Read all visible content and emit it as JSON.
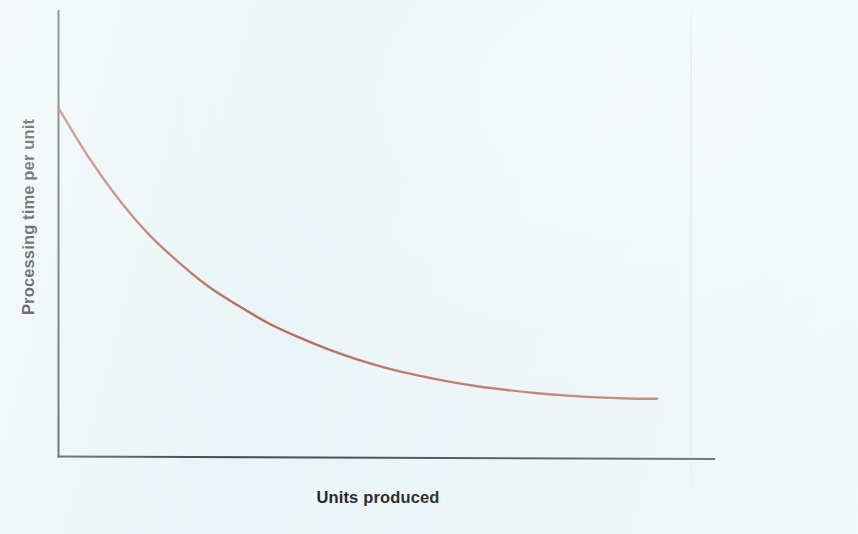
{
  "figure": {
    "background_color": "#eaf4f6",
    "axis_color": "#3f4a4f",
    "curve_color": "#b0604e"
  },
  "axes": {
    "y_axis_label": "Processing time per unit",
    "x_axis_label": "Units produced"
  },
  "chart_data": {
    "type": "line",
    "title": "",
    "subtitle": "",
    "xlabel": "Units produced",
    "ylabel": "Processing time per unit",
    "grid": false,
    "legend": null,
    "tick_labels": {
      "x": [],
      "y": []
    },
    "xlim": [
      0,
      100
    ],
    "ylim": [
      0,
      100
    ],
    "annotations": [],
    "series": [
      {
        "name": "Processing time per unit",
        "color": "#b0604e",
        "line_width": 2,
        "description": "Monotonically decreasing convex curve (experience / learning curve) flattening toward an asymptote",
        "x": [
          0,
          5,
          10,
          15,
          20,
          25,
          30,
          35,
          40,
          45,
          50,
          55,
          60,
          65,
          70,
          75,
          80,
          85,
          90,
          95,
          100
        ],
        "y": [
          100,
          86,
          74,
          64,
          56,
          49,
          43.5,
          38.5,
          34.5,
          31,
          28,
          25.5,
          23.5,
          21.8,
          20.4,
          19.3,
          18.4,
          17.7,
          17.2,
          16.9,
          16.8
        ]
      }
    ]
  }
}
